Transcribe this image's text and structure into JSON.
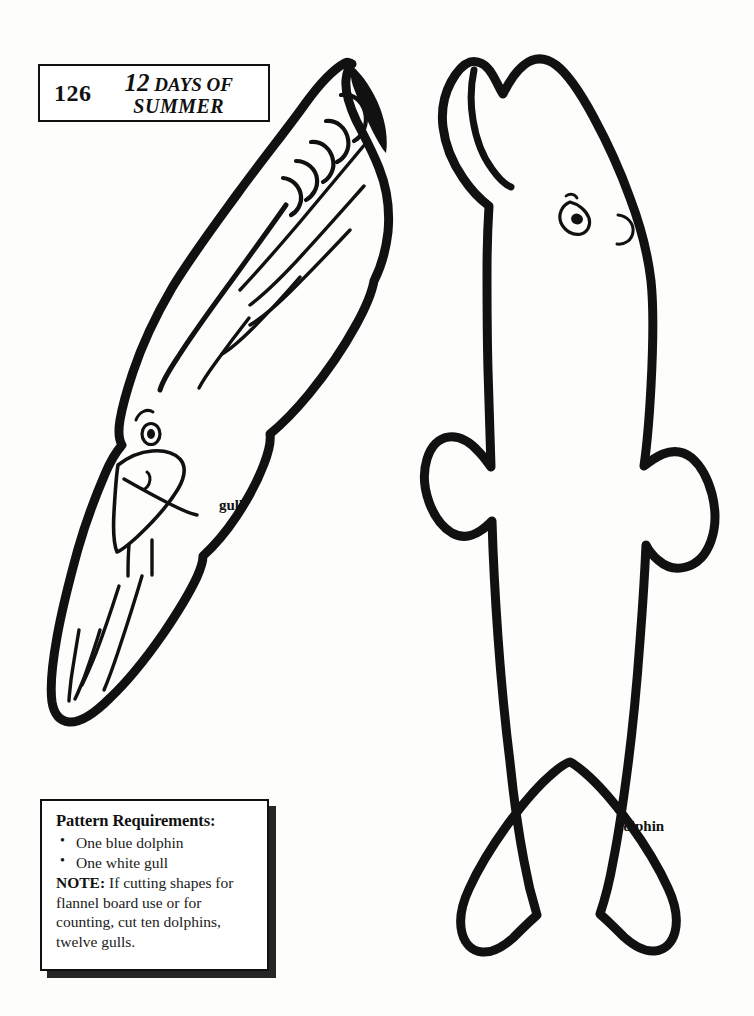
{
  "page": {
    "background_color": "#fdfdfc",
    "ink_color": "#111111",
    "width": 754,
    "height": 1016
  },
  "header": {
    "page_number": "126",
    "title_line_1_emphasis": "12",
    "title_line_1_rest": "DAYS OF",
    "title_line_2": "SUMMER"
  },
  "figures": [
    {
      "name": "gull",
      "label": "gull",
      "description": "Outline pattern of a flying gull with spread wing, feather detail at wing tip, eye and beak"
    },
    {
      "name": "dolphin",
      "label": "dolphin",
      "description": "Outline pattern of a dolphin with beak, eye, dorsal fin, pectoral fin and tail fluke"
    }
  ],
  "labels": {
    "gull": "gull",
    "dolphin": "dolphin"
  },
  "requirements_box": {
    "heading": "Pattern Requirements:",
    "items": [
      "One blue dolphin",
      "One white gull"
    ],
    "note_label": "NOTE:",
    "note_text": " If cutting shapes for flannel board use or for counting, cut ten dolphins, twelve gulls."
  }
}
